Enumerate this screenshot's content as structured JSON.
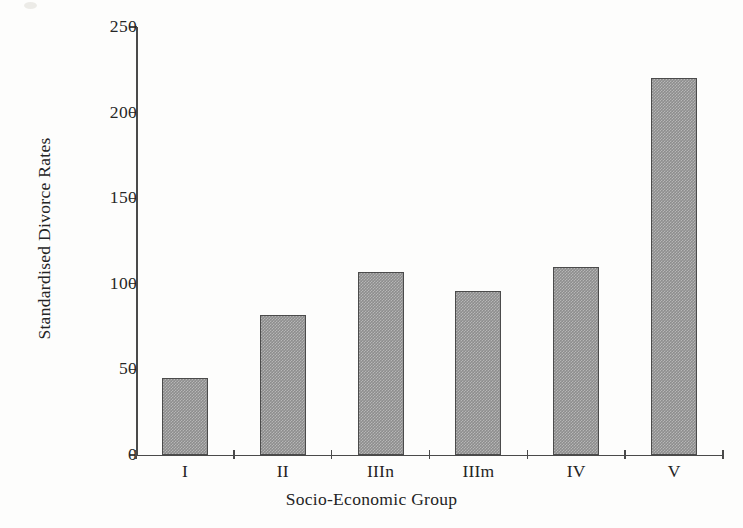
{
  "figure": {
    "background_color": "#fdfdfc",
    "axis_color": "#4a4a4a",
    "bar_fill_color": "#8d8d8d",
    "bar_edge_color": "#4b4b4b"
  },
  "chart_data": {
    "type": "bar",
    "title": "",
    "xlabel": "Socio-Economic Group",
    "ylabel": "Standardised Divorce Rates",
    "categories": [
      "I",
      "II",
      "IIIn",
      "IIIm",
      "IV",
      "V"
    ],
    "values": [
      45,
      82,
      107,
      96,
      110,
      220
    ],
    "ylim": [
      0,
      250
    ],
    "yticks": [
      0,
      50,
      100,
      150,
      200,
      250
    ],
    "ytick_labels": [
      "0",
      "50",
      "100",
      "150",
      "200",
      "250"
    ],
    "grid": false,
    "legend": null,
    "series": [
      {
        "name": "Standardised Divorce Rates",
        "values": [
          45,
          82,
          107,
          96,
          110,
          220
        ]
      }
    ]
  }
}
